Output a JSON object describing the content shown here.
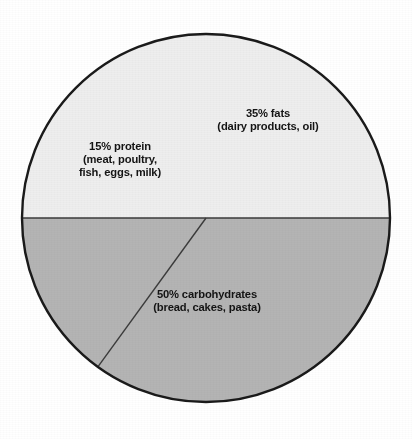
{
  "chart_data": {
    "type": "pie",
    "title": "",
    "subtitle": "",
    "xlabel": "",
    "ylabel": "",
    "legend_position": "none",
    "grid": false,
    "labels_inside_slices": true,
    "start_angle_deg": 180,
    "direction": "clockwise",
    "categories": [
      "carbohydrates",
      "fats",
      "protein"
    ],
    "values": [
      50,
      35,
      15
    ],
    "unit": "%",
    "slices": [
      {
        "name": "carbohydrates",
        "value": 50,
        "percent_text": "50% carbohydrates",
        "detail_text": "(bread, cakes, pasta)",
        "examples": [
          "bread",
          "cakes",
          "pasta"
        ],
        "color": "#eeeeee",
        "angle_deg": 180
      },
      {
        "name": "fats",
        "value": 35,
        "percent_text": "35% fats",
        "detail_text": "(dairy products, oil)",
        "examples": [
          "dairy products",
          "oil"
        ],
        "color": "#b4b4b4",
        "angle_deg": 126
      },
      {
        "name": "protein",
        "value": 15,
        "percent_text": "15% protein",
        "detail_text_line1": "(meat, poultry,",
        "detail_text_line2": "fish, eggs, milk)",
        "examples": [
          "meat",
          "poultry",
          "fish",
          "eggs",
          "milk"
        ],
        "color": "#b4b4b4",
        "angle_deg": 54
      }
    ]
  },
  "figure": {
    "background_color": "#ffffff",
    "outline_color": "#1a1a1a",
    "divider_color": "#3a3a3a",
    "label_color": "#141414"
  }
}
